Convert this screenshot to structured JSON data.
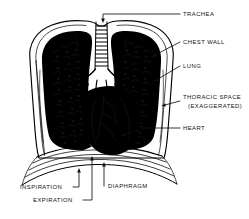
{
  "figure": {
    "type": "line-drawing",
    "ink_color": "#000000",
    "background_color": "#ffffff",
    "label_color": "#111111"
  },
  "labels": {
    "trachea": "TRACHEA",
    "chest_wall": "CHEST WALL",
    "lung": "LUNG",
    "thoracic_space_line1": "THORACIC SPACE",
    "thoracic_space_line2": "(EXAGGERATED)",
    "heart": "HEART",
    "diaphragm": "DIAPHRAGM",
    "inspiration": "INSPIRATION",
    "expiration": "EXPIRATION"
  },
  "structures": [
    "trachea",
    "chest wall",
    "lung",
    "thoracic space",
    "heart",
    "diaphragm"
  ]
}
